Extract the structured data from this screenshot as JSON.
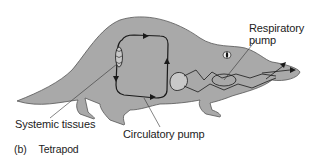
{
  "figure": {
    "panel_tag": "(b)",
    "panel_title": "Tetrapod",
    "colors": {
      "body_fill": "#a9a9a9",
      "outline": "#555555",
      "vessel": "#1a1a1a",
      "background": "#ffffff"
    }
  },
  "labels": {
    "respiratory_pump": "Respiratory pump",
    "systemic_tissues": "Systemic tissues",
    "circulatory_pump": "Circulatory pump"
  }
}
